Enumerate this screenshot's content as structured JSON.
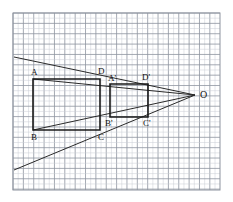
{
  "figure": {
    "type": "geometry-diagram",
    "canvas": {
      "width": 233,
      "height": 202
    },
    "colors": {
      "background": "#ffffff",
      "grid_minor": "#c9ccd4",
      "grid_major": "#8e949f",
      "shape_stroke": "#1a1a1a",
      "ray_stroke": "#2a2a2a",
      "label_text": "#111111"
    },
    "grid": {
      "x0": 13,
      "y0": 13,
      "x1": 220,
      "y1": 190,
      "minor_step": 5.18,
      "major_every": 2,
      "visible": true
    },
    "center": {
      "name": "O",
      "label": "O",
      "x": 195,
      "y": 95,
      "label_x": 200,
      "label_y": 98
    },
    "shapes": [
      {
        "name": "rectangle-abcd",
        "label": "ABCD",
        "vertices": [
          {
            "name": "A",
            "label": "A",
            "x": 33,
            "y": 79,
            "label_x": 31,
            "label_y": 75
          },
          {
            "name": "B",
            "label": "B",
            "x": 33,
            "y": 130,
            "label_x": 31,
            "label_y": 140
          },
          {
            "name": "C",
            "label": "C",
            "x": 100,
            "y": 130,
            "label_x": 98,
            "label_y": 140
          },
          {
            "name": "D",
            "label": "D",
            "x": 100,
            "y": 79,
            "label_x": 98,
            "label_y": 74
          }
        ]
      },
      {
        "name": "rectangle-a-prime-b-prime-c-prime-d-prime",
        "label": "A'B'C'D'",
        "vertices": [
          {
            "name": "A-prime",
            "label": "A'",
            "x": 110,
            "y": 84,
            "label_x": 108,
            "label_y": 81
          },
          {
            "name": "B-prime",
            "label": "B'",
            "x": 110,
            "y": 117,
            "label_x": 105,
            "label_y": 126
          },
          {
            "name": "C-prime",
            "label": "C'",
            "x": 148,
            "y": 117,
            "label_x": 143,
            "label_y": 126
          },
          {
            "name": "D-prime",
            "label": "D'",
            "x": 148,
            "y": 84,
            "label_x": 142,
            "label_y": 80
          }
        ]
      }
    ],
    "rays": [
      {
        "name": "ray-through-a",
        "from_label": "A",
        "x1": 14,
        "y1": 57,
        "x2": 195,
        "y2": 95
      },
      {
        "name": "ray-through-b",
        "from_label": "B",
        "x1": 14,
        "y1": 170,
        "x2": 195,
        "y2": 95
      },
      {
        "name": "ray-through-d",
        "from_label": "D",
        "x1": 33,
        "y1": 79,
        "x2": 195,
        "y2": 95
      },
      {
        "name": "ray-through-c",
        "from_label": "C",
        "x1": 33,
        "y1": 130,
        "x2": 195,
        "y2": 95
      }
    ]
  }
}
